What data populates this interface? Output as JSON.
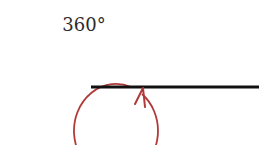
{
  "diagram": {
    "angle_label": "360°",
    "angle_degrees": 360,
    "colors": {
      "arc": "#b03a3a",
      "ray": "#111111",
      "text": "#2b2b2b"
    }
  }
}
